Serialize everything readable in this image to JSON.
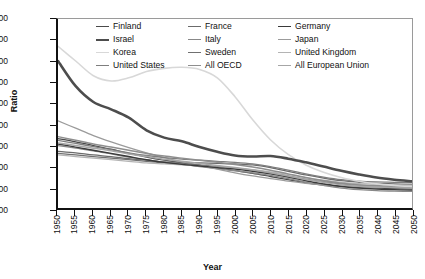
{
  "chart_data": {
    "type": "line",
    "title": "",
    "xlabel": "Year",
    "ylabel": "Ratio",
    "xlim": [
      1950,
      2050
    ],
    "ylim": [
      0.0,
      18.0
    ],
    "ytick_step": 2.0,
    "xtick_step": 5,
    "grid": false,
    "legend_position": "top-inside",
    "xticks": [
      "1950",
      "1955",
      "1960",
      "1965",
      "1970",
      "1975",
      "1980",
      "1985",
      "1990",
      "1995",
      "2000",
      "2005",
      "2010",
      "2015",
      "2020",
      "2025",
      "2030",
      "2035",
      "2040",
      "2045",
      "2050"
    ],
    "yticks": [
      "0.00",
      "2.00",
      "4.00",
      "6.00",
      "8.00",
      "10.00",
      "12.00",
      "14.00",
      "16.00",
      "18.00"
    ],
    "x": [
      1950,
      1955,
      1960,
      1965,
      1970,
      1975,
      1980,
      1985,
      1990,
      1995,
      2000,
      2005,
      2010,
      2015,
      2020,
      2025,
      2030,
      2035,
      2040,
      2045,
      2050
    ],
    "series": [
      {
        "name": "Finland",
        "color": "#4a4a4a",
        "width": 1.3,
        "values": [
          6.6,
          6.3,
          5.95,
          5.6,
          5.2,
          4.85,
          4.55,
          4.3,
          4.05,
          3.8,
          3.55,
          3.3,
          3.0,
          2.7,
          2.4,
          2.2,
          2.05,
          1.95,
          1.9,
          1.85,
          1.8
        ]
      },
      {
        "name": "France",
        "color": "#6b6b6b",
        "width": 1.3,
        "values": [
          5.4,
          5.25,
          5.05,
          4.9,
          4.7,
          4.55,
          4.4,
          4.35,
          4.3,
          4.25,
          4.2,
          4.1,
          3.85,
          3.5,
          3.15,
          2.85,
          2.6,
          2.45,
          2.35,
          2.3,
          2.25
        ]
      },
      {
        "name": "Germany",
        "color": "#3a3a3a",
        "width": 1.4,
        "values": [
          6.1,
          5.8,
          5.5,
          5.2,
          4.9,
          4.6,
          4.35,
          4.15,
          4.0,
          3.85,
          3.7,
          3.5,
          3.25,
          2.95,
          2.6,
          2.3,
          2.05,
          1.9,
          1.8,
          1.75,
          1.7
        ]
      },
      {
        "name": "Israel",
        "color": "#4d4d4d",
        "width": 2.6,
        "values": [
          14.0,
          11.6,
          10.1,
          9.4,
          8.6,
          7.4,
          6.7,
          6.35,
          5.8,
          5.35,
          5.0,
          4.9,
          4.95,
          4.7,
          4.35,
          3.95,
          3.55,
          3.2,
          2.9,
          2.7,
          2.55
        ]
      },
      {
        "name": "Italy",
        "color": "#888888",
        "width": 1.3,
        "values": [
          5.95,
          5.7,
          5.45,
          5.15,
          4.85,
          4.6,
          4.35,
          4.15,
          3.95,
          3.75,
          3.55,
          3.35,
          3.1,
          2.8,
          2.45,
          2.15,
          1.9,
          1.75,
          1.65,
          1.6,
          1.58
        ]
      },
      {
        "name": "Japan",
        "color": "#9b9b9b",
        "width": 1.3,
        "values": [
          8.3,
          7.6,
          6.9,
          6.3,
          5.75,
          5.25,
          4.8,
          4.4,
          4.05,
          3.7,
          3.35,
          3.05,
          2.8,
          2.55,
          2.35,
          2.2,
          2.1,
          2.02,
          1.98,
          1.95,
          1.92
        ]
      },
      {
        "name": "Korea",
        "color": "#d8d8d8",
        "width": 1.6,
        "values": [
          15.4,
          14.0,
          12.6,
          12.1,
          12.4,
          13.0,
          13.3,
          13.4,
          13.2,
          12.4,
          10.6,
          8.4,
          6.5,
          5.1,
          4.1,
          3.4,
          2.9,
          2.55,
          2.3,
          2.15,
          2.05
        ]
      },
      {
        "name": "Sweden",
        "color": "#707070",
        "width": 1.3,
        "values": [
          5.2,
          5.05,
          4.9,
          4.75,
          4.6,
          4.45,
          4.3,
          4.2,
          4.1,
          3.95,
          3.8,
          3.6,
          3.35,
          3.05,
          2.75,
          2.5,
          2.3,
          2.18,
          2.1,
          2.05,
          2.02
        ]
      },
      {
        "name": "United Kingdom",
        "color": "#b4b4b4",
        "width": 1.3,
        "values": [
          5.05,
          4.9,
          4.75,
          4.6,
          4.45,
          4.3,
          4.2,
          4.1,
          4.0,
          3.9,
          3.8,
          3.65,
          3.45,
          3.2,
          2.9,
          2.65,
          2.45,
          2.32,
          2.25,
          2.2,
          2.18
        ]
      },
      {
        "name": "United States",
        "color": "#7e7e7e",
        "width": 1.3,
        "values": [
          6.45,
          6.15,
          5.85,
          5.55,
          5.25,
          5.0,
          4.8,
          4.65,
          4.55,
          4.45,
          4.35,
          4.2,
          3.95,
          3.6,
          3.25,
          2.95,
          2.7,
          2.55,
          2.48,
          2.45,
          2.42
        ]
      },
      {
        "name": "All OECD",
        "color": "#8e8e8e",
        "width": 1.5,
        "values": [
          6.8,
          6.45,
          6.1,
          5.8,
          5.5,
          5.2,
          4.95,
          4.75,
          4.55,
          4.35,
          4.15,
          3.9,
          3.6,
          3.25,
          2.9,
          2.6,
          2.35,
          2.2,
          2.12,
          2.08,
          2.05
        ]
      },
      {
        "name": "All European Union",
        "color": "#a6a6a6",
        "width": 1.5,
        "values": [
          6.2,
          5.95,
          5.7,
          5.45,
          5.15,
          4.9,
          4.65,
          4.45,
          4.25,
          4.05,
          3.85,
          3.62,
          3.35,
          3.05,
          2.72,
          2.45,
          2.22,
          2.08,
          2.0,
          1.96,
          1.94
        ]
      }
    ]
  },
  "legend": {
    "items": [
      {
        "label": "Finland"
      },
      {
        "label": "France"
      },
      {
        "label": "Germany"
      },
      {
        "label": "Israel"
      },
      {
        "label": "Italy"
      },
      {
        "label": "Japan"
      },
      {
        "label": "Korea"
      },
      {
        "label": "Sweden"
      },
      {
        "label": "United Kingdom"
      },
      {
        "label": "United States"
      },
      {
        "label": "All OECD"
      },
      {
        "label": "All European Union"
      }
    ]
  }
}
